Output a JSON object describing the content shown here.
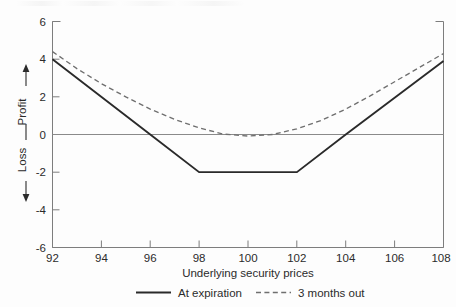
{
  "chart_data": {
    "type": "line",
    "title": "",
    "xlabel": "Underlying security prices",
    "ylabel_positive": "Profit",
    "ylabel_negative": "Loss",
    "xlim": [
      92,
      108
    ],
    "ylim": [
      -6,
      6
    ],
    "xticks": [
      92,
      94,
      96,
      98,
      100,
      102,
      104,
      106,
      108
    ],
    "yticks": [
      6,
      4,
      2,
      0,
      -2,
      -4,
      -6
    ],
    "grid": false,
    "zero_line": true,
    "legend_position": "below",
    "series": [
      {
        "name": "At expiration",
        "style": "solid",
        "color": "#2a2a2a",
        "x": [
          92,
          96,
          98,
          102,
          104,
          108
        ],
        "values": [
          4.0,
          0.0,
          -2.0,
          -2.0,
          0.0,
          3.9
        ]
      },
      {
        "name": "3 months out",
        "style": "dashed",
        "color": "#6f6f6f",
        "x": [
          92,
          93,
          94,
          95,
          96,
          97,
          98,
          99,
          100,
          101,
          102,
          103,
          104,
          105,
          106,
          107,
          108
        ],
        "values": [
          4.4,
          3.5,
          2.7,
          2.0,
          1.35,
          0.8,
          0.35,
          0.02,
          -0.08,
          0.0,
          0.3,
          0.75,
          1.35,
          2.05,
          2.8,
          3.55,
          4.3
        ]
      }
    ]
  },
  "axes": {
    "x_tick_labels": [
      "92",
      "94",
      "96",
      "98",
      "100",
      "102",
      "104",
      "106",
      "108"
    ],
    "y_tick_labels": [
      "6",
      "4",
      "2",
      "0",
      "-2",
      "-4",
      "-6"
    ],
    "x_axis_title": "Underlying security prices",
    "y_axis_profit_label": "Profit",
    "y_axis_loss_label": "Loss"
  },
  "legend": {
    "items": [
      {
        "label": "At expiration",
        "style": "solid"
      },
      {
        "label": "3 months out",
        "style": "dashed"
      }
    ]
  }
}
